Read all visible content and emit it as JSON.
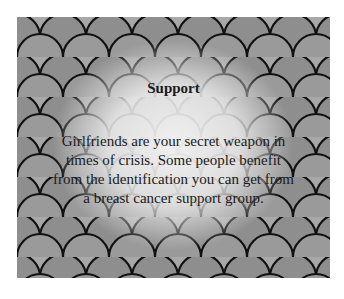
{
  "card": {
    "title": "Support",
    "body": "Girlfriends are your secret weapon in times of crisis. Some people benefit from the identification you can get from a breast cancer support group.",
    "background": "grayscale-fish-scale-pattern",
    "colors": {
      "text": "#1a1a1a",
      "page_bg": "#ffffff"
    }
  }
}
